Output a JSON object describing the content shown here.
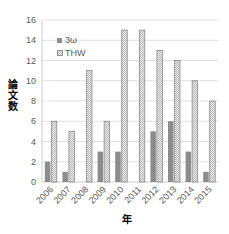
{
  "chart_data": {
    "type": "bar",
    "title": "",
    "xlabel": "年",
    "ylabel": "論文数",
    "ylim": [
      0,
      16
    ],
    "yticks": [
      0,
      2,
      4,
      6,
      8,
      10,
      12,
      14,
      16
    ],
    "grid": true,
    "legend_position": "upper-left-inside",
    "categories": [
      "2006",
      "2007",
      "2008",
      "2009",
      "2010",
      "2011",
      "2012",
      "2013",
      "2014",
      "2015"
    ],
    "series": [
      {
        "name": "3ω",
        "color": "#8c8c8c",
        "pattern": "solid",
        "values": [
          2,
          1,
          0,
          3,
          3,
          0,
          5,
          6,
          3,
          1
        ]
      },
      {
        "name": "THW",
        "color": "#d9d9d9",
        "pattern": "hatched",
        "values": [
          6,
          5,
          11,
          6,
          15,
          15,
          13,
          12,
          10,
          8
        ]
      }
    ]
  },
  "colors": {
    "grid": "#d9d9d9",
    "axis": "#bfbfbf",
    "series_a": "#8c8c8c",
    "series_b": "#e6e6e6",
    "series_b_border": "#7f7f7f"
  }
}
